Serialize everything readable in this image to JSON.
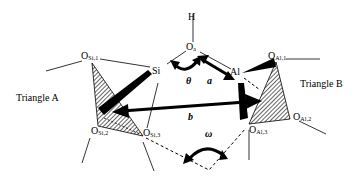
{
  "diagram": {
    "triangles": {
      "a": {
        "label": "Triangle A"
      },
      "b": {
        "label": "Triangle B"
      }
    },
    "atoms": {
      "H": {
        "label": "H"
      },
      "Oa": {
        "main": "O",
        "sub": "a"
      },
      "Si": {
        "label": "Si"
      },
      "Al": {
        "label": "Al"
      },
      "OSi1": {
        "main": "O",
        "sub": "Si,1"
      },
      "OSi2": {
        "main": "O",
        "sub": "Si,2"
      },
      "OSi3": {
        "main": "O",
        "sub": "Si,3"
      },
      "OAl1": {
        "main": "O",
        "sub": "Al,1"
      },
      "OAl2": {
        "main": "O",
        "sub": "Al,2"
      },
      "OAl3": {
        "main": "O",
        "sub": "Al,3"
      }
    },
    "parameters": {
      "theta": "θ",
      "a": "a",
      "b": "b",
      "omega": "ω"
    },
    "colors": {
      "line": "#000000",
      "hatch": "#000000",
      "background": "#ffffff"
    }
  }
}
